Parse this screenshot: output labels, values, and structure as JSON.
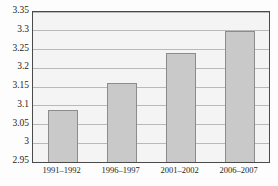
{
  "chart_data": {
    "type": "bar",
    "title": "",
    "subtitle": "",
    "xlabel": "",
    "ylabel": "",
    "categories": [
      "1991–1992",
      "1996–1997",
      "2001–2002",
      "2006–2007"
    ],
    "values": [
      3.09,
      3.16,
      3.24,
      3.3
    ],
    "ylim": [
      2.95,
      3.35
    ],
    "ytick_step": 0.05,
    "ytick_labels": [
      "2.95",
      "3",
      "3.05",
      "3.1",
      "3.15",
      "3.2",
      "3.25",
      "3.3",
      "3.35"
    ],
    "ytick_values": [
      2.95,
      3,
      3.05,
      3.1,
      3.15,
      3.2,
      3.25,
      3.3,
      3.35
    ],
    "grid": true,
    "grid_orientation": "horizontal",
    "legend": false,
    "legend_position": "none",
    "colors": {
      "bar_fill": "#c9c9c9",
      "bar_border": "#8c8c8c",
      "plot_background": "#f4f4f4",
      "frame": "#4a4a4a",
      "gridline": "#b9b9b9",
      "text": "#1d1d1d",
      "page_background": "#fdfdfd"
    }
  }
}
